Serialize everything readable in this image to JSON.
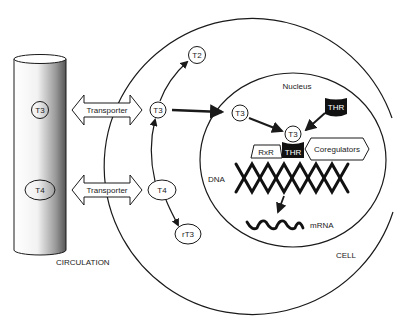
{
  "diagram": {
    "regions": {
      "circulation_label": "CIRCULATION",
      "cell_label": "CELL",
      "nucleus_label": "Nucleus",
      "dna_label": "DNA",
      "mrna_label": "mRNA"
    },
    "circulation": {
      "t3": "T3",
      "t4": "T4"
    },
    "transporters": [
      {
        "label": "Transporter"
      },
      {
        "label": "Transporter"
      }
    ],
    "cytoplasm": {
      "t3": "T3",
      "t4": "T4",
      "t2": "T2",
      "rt3": "rT3"
    },
    "nucleus": {
      "t3": "T3",
      "bound_t3": "T3",
      "thr_free": "THR",
      "thr_bound": "THR",
      "rxr": "RxR",
      "coregulators": "Coregulators"
    },
    "colors": {
      "line": "#1a1a1a",
      "receptor_fill": "#111111",
      "receptor_text": "#ffffff",
      "background": "#ffffff"
    }
  }
}
